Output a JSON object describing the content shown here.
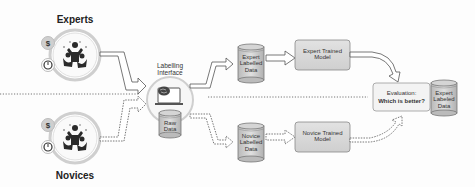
{
  "groups": {
    "experts": {
      "label": "Experts",
      "icons": [
        "dollar-icon",
        "timer-icon",
        "people-cheering-icon"
      ]
    },
    "novices": {
      "label": "Novices",
      "icons": [
        "dollar-icon",
        "timer-icon",
        "people-cheering-icon"
      ]
    }
  },
  "labelling_interface": {
    "label": "Labelling Interface",
    "icon": "brain-laptop-icon"
  },
  "raw_data": {
    "label": "Raw Data"
  },
  "expert_labeled_data": {
    "label": "Expert Labelled Data"
  },
  "novice_labeled_data": {
    "label": "Novice Labelled Data"
  },
  "expert_model": {
    "label": "Expert Trained Model"
  },
  "novice_model": {
    "label": "Novice Trained Model"
  },
  "evaluation": {
    "line1": "Evaluation:",
    "line2": "Which is better?"
  },
  "eval_data": {
    "label": "Expert Labeled Data"
  },
  "colors": {
    "box_fill": "#dcdcdc",
    "box_stroke": "#8a8a8a",
    "circle_stroke": "#c8c8c8",
    "eval_fill": "#f4f4f4",
    "divider": "#888888"
  }
}
